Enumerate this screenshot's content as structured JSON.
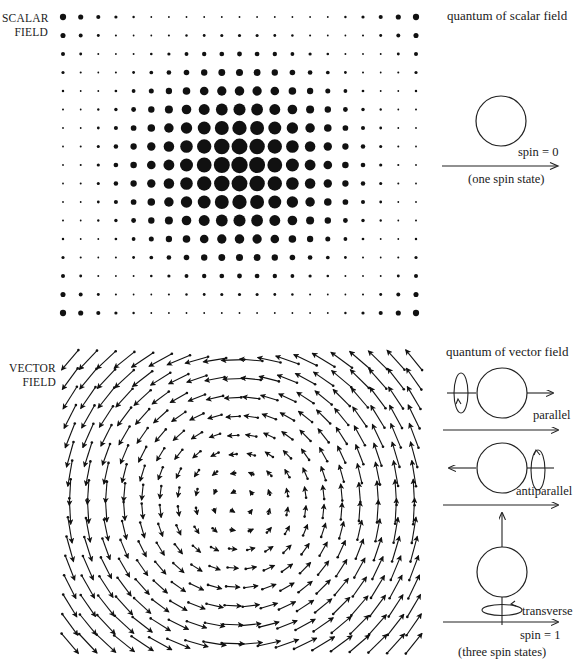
{
  "scalar": {
    "label_line1": "SCALAR",
    "label_line2": "FIELD",
    "title": "quantum of scalar field",
    "spin_label": "spin  =  0",
    "states_label": "(one spin state)",
    "grid": {
      "x0": 63,
      "y0": 17,
      "dx": 17.65,
      "dy": 18.5,
      "cols": 21,
      "rows": 17,
      "center_col": 10,
      "center_row": 8,
      "max_radius": 8.2,
      "min_radius": 0.9,
      "corner_radius": 3.4
    },
    "color": "#111111"
  },
  "vector": {
    "label_line1": "VECTOR",
    "label_line2": "FIELD",
    "title": "quantum of vector field",
    "states": [
      {
        "name": "parallel",
        "label": "parallel"
      },
      {
        "name": "antiparallel",
        "label": "antiparallel"
      },
      {
        "name": "transverse",
        "label": "transverse"
      }
    ],
    "spin_label": "spin  =  1",
    "states_label": "(three spin states)",
    "grid": {
      "x0": 70,
      "y0": 360,
      "dx": 18.1,
      "dy": 18.9,
      "cols": 20,
      "rows": 16,
      "center_x": 238,
      "center_y": 502,
      "scale": 0.16,
      "max_len": 26,
      "min_len": 4
    },
    "color": "#111111"
  }
}
